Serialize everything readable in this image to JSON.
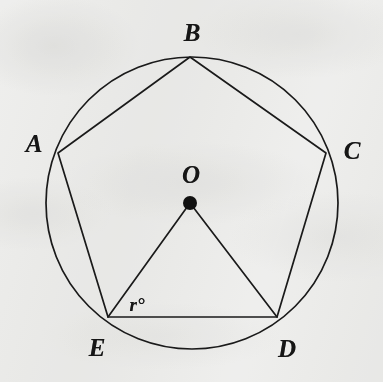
{
  "figure": {
    "background_color": "#f4f4f3",
    "ink_color": "#1a1a1a",
    "stroke_width": 1.7,
    "circle": {
      "name": "circumscribed-circle",
      "center_x": 192,
      "center_y": 203,
      "radius": 146
    },
    "center_point": {
      "name": "center-point-O",
      "x": 190,
      "y": 203,
      "dot_radius": 7,
      "label": "O",
      "label_x": 191,
      "label_y": 174
    },
    "vertices": [
      {
        "id": "A",
        "label": "A",
        "x": 58,
        "y": 153,
        "label_x": 34,
        "label_y": 143
      },
      {
        "id": "B",
        "label": "B",
        "x": 190,
        "y": 57,
        "label_x": 192,
        "label_y": 32
      },
      {
        "id": "C",
        "label": "C",
        "x": 326,
        "y": 153,
        "label_x": 352,
        "label_y": 150
      },
      {
        "id": "D",
        "label": "D",
        "x": 277,
        "y": 317,
        "label_x": 287,
        "label_y": 348
      },
      {
        "id": "E",
        "label": "E",
        "x": 108,
        "y": 317,
        "label_x": 97,
        "label_y": 347
      }
    ],
    "polygon": {
      "name": "inscribed-pentagon-ABCDE",
      "points": "58,153 190,57 326,153 277,317 108,317",
      "closed": true
    },
    "radii": [
      {
        "name": "radius-OE",
        "x1": 190,
        "y1": 203,
        "x2": 108,
        "y2": 317
      },
      {
        "name": "radius-OD",
        "x1": 190,
        "y1": 203,
        "x2": 277,
        "y2": 317
      }
    ],
    "angle_marker": {
      "name": "angle-r-at-E",
      "label": "r°",
      "vertex": "E",
      "label_x": 137,
      "label_y": 304
    }
  }
}
